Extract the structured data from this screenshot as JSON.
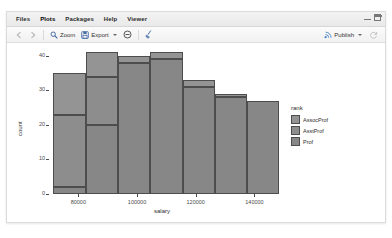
{
  "window": {
    "tabs": [
      {
        "label": "Files",
        "active": false
      },
      {
        "label": "Plots",
        "active": true
      },
      {
        "label": "Packages",
        "active": false
      },
      {
        "label": "Help",
        "active": false
      },
      {
        "label": "Viewer",
        "active": false
      }
    ],
    "controls": {
      "minimize": "minimize-icon",
      "maximize": "maximize-icon"
    }
  },
  "toolbar": {
    "back_icon": "back-arrow-icon",
    "forward_icon": "forward-arrow-icon",
    "zoom_label": "Zoom",
    "zoom_icon": "magnifier-icon",
    "export_label": "Export",
    "export_icon": "export-disk-icon",
    "remove_icon": "remove-circle-icon",
    "clear_icon": "broom-icon",
    "publish_label": "Publish",
    "publish_icon": "publish-icon",
    "refresh_icon": "refresh-icon"
  },
  "chart_data": {
    "type": "bar",
    "stacked": true,
    "title": "",
    "xlabel": "salary",
    "ylabel": "count",
    "xlim": [
      70000,
      147000
    ],
    "ylim": [
      0,
      42
    ],
    "xticks": [
      80000,
      100000,
      120000,
      140000
    ],
    "xtick_labels": [
      "80000",
      "100000",
      "120000",
      "140000"
    ],
    "yticks": [
      0,
      10,
      20,
      30,
      40
    ],
    "ytick_labels": [
      "0",
      "10",
      "20",
      "30",
      "40"
    ],
    "grid": false,
    "legend": {
      "title": "rank",
      "position": "right",
      "entries": [
        {
          "name": "AssocProf",
          "color": "#949494"
        },
        {
          "name": "AsstProf",
          "color": "#8d8d8d"
        },
        {
          "name": "Prof",
          "color": "#878787"
        }
      ]
    },
    "bins": [
      {
        "x0": 71500,
        "x1": 82500,
        "total": 35,
        "AssocProf": 12,
        "AsstProf": 21,
        "Prof": 2
      },
      {
        "x0": 82500,
        "x1": 93500,
        "total": 41,
        "AssocProf": 7,
        "AsstProf": 14,
        "Prof": 20
      },
      {
        "x0": 93500,
        "x1": 104500,
        "total": 40,
        "AssocProf": 2,
        "AsstProf": 0,
        "Prof": 38
      },
      {
        "x0": 104500,
        "x1": 115500,
        "total": 41,
        "AssocProf": 2,
        "AsstProf": 0,
        "Prof": 39
      },
      {
        "x0": 115500,
        "x1": 126500,
        "total": 33,
        "AssocProf": 2,
        "AsstProf": 0,
        "Prof": 31
      },
      {
        "x0": 126500,
        "x1": 137500,
        "total": 29,
        "AssocProf": 1,
        "AsstProf": 0,
        "Prof": 28
      },
      {
        "x0": 137500,
        "x1": 148500,
        "total": 27,
        "AssocProf": 0,
        "AsstProf": 0,
        "Prof": 27
      }
    ],
    "series": [
      {
        "name": "AssocProf",
        "values": [
          12,
          7,
          2,
          2,
          2,
          1,
          0
        ]
      },
      {
        "name": "AsstProf",
        "values": [
          21,
          14,
          0,
          0,
          0,
          0,
          0
        ]
      },
      {
        "name": "Prof",
        "values": [
          2,
          20,
          38,
          39,
          31,
          28,
          27
        ]
      }
    ],
    "categories": [
      "77000",
      "88000",
      "99000",
      "110000",
      "121000",
      "132000",
      "143000"
    ]
  }
}
